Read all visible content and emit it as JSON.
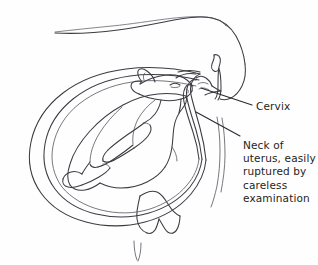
{
  "figure": {
    "name": "bovine-uterus-fetus-diagram",
    "background_color": "#fefefe",
    "ink_color": "#3b3b42",
    "label_color": "#1e1e22"
  },
  "labels": {
    "cervix": {
      "text": "Cervix",
      "name": "cervix-label"
    },
    "neck_of_uterus": {
      "text": "Neck of\nuterus, easily\nruptured by\ncareless\nexamination",
      "name": "neck-of-uterus-label"
    }
  },
  "anatomy_parts": [
    "cow-body-outline",
    "cow-back-line",
    "tail-head",
    "vulva",
    "uterus-wall-outer",
    "uterus-wall-inner",
    "cervix-canal",
    "fetus-body",
    "fetus-head",
    "fetus-ear",
    "fetus-eye",
    "fetus-forelimb",
    "fetus-hindlimb",
    "udder",
    "hind-leg"
  ],
  "leader_lines": [
    {
      "name": "cervix-leader-line",
      "from": "cervix-region",
      "to": "cervix-label"
    },
    {
      "name": "neck-of-uterus-leader-line",
      "from": "uterine-neck-region",
      "to": "neck-of-uterus-label"
    }
  ]
}
